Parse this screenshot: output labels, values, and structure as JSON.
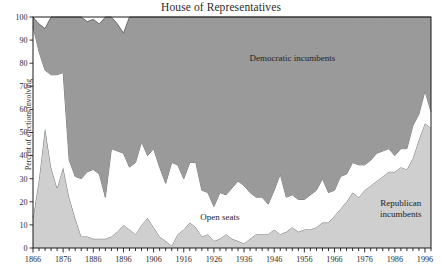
{
  "chart_data": {
    "type": "area",
    "stacked": true,
    "title": "House of Representatives",
    "xlabel": "",
    "ylabel": "Percent of elections involving",
    "xlim": [
      1866,
      1998
    ],
    "ylim": [
      0,
      100
    ],
    "grid": false,
    "legend_position": "inline-annotations",
    "x_tick_step_minor": 2,
    "x_tick_step_major": 10,
    "y_tick_step": 10,
    "colors": {
      "democratic_incumbents": "#9a9a9a",
      "open_seats": "#ffffff",
      "republican_incumbents": "#cfcfcf",
      "axis": "#1a1a1a",
      "outline": "#555555"
    },
    "annotations": [
      {
        "text": "Democratic incumbents",
        "x": 1952,
        "y": 81
      },
      {
        "text": "Open seats",
        "x": 1928,
        "y": 12
      },
      {
        "text": "Republican incumbents",
        "x": 1988,
        "y": 18,
        "lines": [
          "Republican",
          "incumbents"
        ]
      }
    ],
    "x_tick_labels": [
      "1866",
      "1876",
      "1886",
      "1896",
      "1906",
      "1916",
      "1926",
      "1936",
      "1946",
      "1956",
      "1966",
      "1976",
      "1986",
      "1996"
    ],
    "y_tick_labels": [
      "0",
      "10",
      "20",
      "30",
      "40",
      "50",
      "60",
      "70",
      "80",
      "90",
      "100"
    ],
    "x": [
      1866,
      1868,
      1870,
      1872,
      1874,
      1876,
      1878,
      1880,
      1882,
      1884,
      1886,
      1888,
      1890,
      1892,
      1894,
      1896,
      1898,
      1900,
      1902,
      1904,
      1906,
      1908,
      1910,
      1912,
      1914,
      1916,
      1918,
      1920,
      1922,
      1924,
      1926,
      1928,
      1930,
      1932,
      1934,
      1936,
      1938,
      1940,
      1942,
      1944,
      1946,
      1948,
      1950,
      1952,
      1954,
      1956,
      1958,
      1960,
      1962,
      1964,
      1966,
      1968,
      1970,
      1972,
      1974,
      1976,
      1978,
      1980,
      1982,
      1984,
      1986,
      1988,
      1990,
      1992,
      1994,
      1996,
      1998
    ],
    "series": [
      {
        "name": "Republican incumbents",
        "values": [
          13,
          30,
          52,
          35,
          26,
          35,
          22,
          13,
          5,
          5,
          4,
          4,
          4,
          5,
          7,
          10,
          8,
          6,
          10,
          13,
          9,
          5,
          3,
          1,
          6,
          8,
          11,
          9,
          5,
          6,
          3,
          4,
          6,
          4,
          3,
          2,
          4,
          6,
          6,
          6,
          8,
          6,
          7,
          9,
          7,
          8,
          8,
          9,
          11,
          11,
          14,
          17,
          20,
          24,
          22,
          25,
          27,
          29,
          31,
          33,
          33,
          35,
          34,
          39,
          47,
          54,
          52
        ]
      },
      {
        "name": "Open seats",
        "values": [
          83,
          55,
          25,
          40,
          49,
          41,
          16,
          18,
          25,
          28,
          30,
          28,
          18,
          38,
          35,
          31,
          27,
          31,
          36,
          27,
          34,
          30,
          25,
          36,
          30,
          22,
          26,
          28,
          20,
          18,
          15,
          20,
          17,
          22,
          26,
          25,
          20,
          16,
          16,
          13,
          17,
          26,
          15,
          14,
          14,
          13,
          15,
          16,
          19,
          13,
          11,
          14,
          12,
          13,
          14,
          11,
          11,
          12,
          11,
          10,
          7,
          8,
          9,
          14,
          11,
          14,
          7
        ]
      },
      {
        "name": "Democratic incumbents",
        "values": [
          4,
          12,
          18,
          25,
          25,
          24,
          62,
          69,
          70,
          65,
          65,
          65,
          78,
          57,
          55,
          52,
          65,
          63,
          54,
          60,
          57,
          65,
          72,
          63,
          64,
          70,
          63,
          63,
          75,
          76,
          82,
          76,
          77,
          74,
          71,
          73,
          76,
          78,
          78,
          81,
          75,
          68,
          78,
          77,
          79,
          79,
          77,
          75,
          70,
          76,
          75,
          69,
          68,
          63,
          64,
          64,
          62,
          59,
          58,
          57,
          60,
          57,
          57,
          47,
          42,
          32,
          41
        ]
      }
    ]
  }
}
